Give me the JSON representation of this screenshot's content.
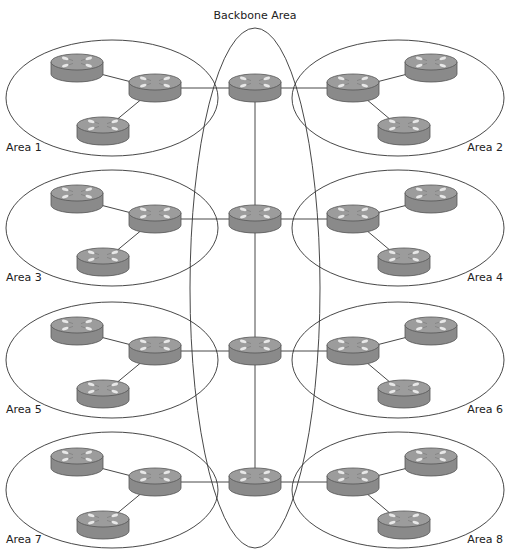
{
  "diagram": {
    "title": "Backbone Area",
    "colors": {
      "router_body": "#8a8a8a",
      "router_top": "#9c9c9c",
      "router_edge": "#555555",
      "router_arrows": "#e8e8e8",
      "lines": "#333333"
    },
    "areas": [
      {
        "id": "area-1",
        "label": "Area 1",
        "side": "left"
      },
      {
        "id": "area-2",
        "label": "Area 2",
        "side": "right"
      },
      {
        "id": "area-3",
        "label": "Area 3",
        "side": "left"
      },
      {
        "id": "area-4",
        "label": "Area 4",
        "side": "right"
      },
      {
        "id": "area-5",
        "label": "Area 5",
        "side": "left"
      },
      {
        "id": "area-6",
        "label": "Area 6",
        "side": "right"
      },
      {
        "id": "area-7",
        "label": "Area 7",
        "side": "left"
      },
      {
        "id": "area-8",
        "label": "Area 8",
        "side": "right"
      }
    ],
    "backbone_router_count": 4,
    "routers_per_area": 3,
    "icons": {
      "router": "router-icon"
    }
  }
}
